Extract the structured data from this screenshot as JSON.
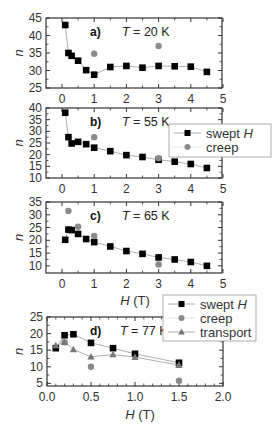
{
  "chart_data": [
    {
      "type": "scatter",
      "panel": "a)",
      "annotation": "T = 20 K",
      "xlabel": "",
      "ylabel": "n",
      "xlim": [
        -0.5,
        5
      ],
      "ylim": [
        25,
        45
      ],
      "xticks": [
        0,
        1,
        2,
        3,
        4,
        5
      ],
      "yticks": [
        25,
        30,
        35,
        40,
        45
      ],
      "series": [
        {
          "name": "swept H",
          "marker": "square",
          "color": "#000000",
          "line": true,
          "x": [
            0.1,
            0.2,
            0.3,
            0.5,
            0.75,
            1,
            1.5,
            2,
            2.5,
            3,
            3.5,
            4,
            4.5
          ],
          "y": [
            43,
            35,
            34.2,
            32.8,
            30.1,
            28.8,
            31,
            31.3,
            30.8,
            31.3,
            31.2,
            31.1,
            29.6
          ]
        },
        {
          "name": "creep",
          "marker": "circle",
          "color": "#8a8a8a",
          "line": false,
          "x": [
            1,
            3
          ],
          "y": [
            34.8,
            37
          ]
        }
      ]
    },
    {
      "type": "scatter",
      "panel": "b)",
      "annotation": "T = 55 K",
      "xlabel": "",
      "ylabel": "n",
      "xlim": [
        -0.5,
        5
      ],
      "ylim": [
        10,
        40
      ],
      "xticks": [
        0,
        1,
        2,
        3,
        4,
        5
      ],
      "yticks": [
        10,
        15,
        20,
        25,
        30,
        35,
        40
      ],
      "legend": [
        "swept H",
        "creep"
      ],
      "series": [
        {
          "name": "swept H",
          "marker": "square",
          "color": "#000000",
          "line": true,
          "x": [
            0.1,
            0.2,
            0.3,
            0.5,
            0.75,
            1,
            1.5,
            2,
            2.5,
            3,
            3.5,
            4,
            4.5
          ],
          "y": [
            38,
            27.5,
            24.8,
            25.5,
            24.5,
            23,
            21.5,
            19.8,
            19,
            17.8,
            17,
            16,
            14.3
          ]
        },
        {
          "name": "creep",
          "marker": "circle",
          "color": "#8a8a8a",
          "line": false,
          "x": [
            1,
            3
          ],
          "y": [
            27.5,
            18.5
          ]
        }
      ]
    },
    {
      "type": "scatter",
      "panel": "c)",
      "annotation": "T = 65 K",
      "xlabel": "H (T)",
      "ylabel": "n",
      "xlim": [
        -0.5,
        5
      ],
      "ylim": [
        7.2,
        35
      ],
      "xticks": [
        0,
        1,
        2,
        3,
        4,
        5
      ],
      "yticks": [
        10,
        15,
        20,
        25,
        30,
        35
      ],
      "series": [
        {
          "name": "swept H",
          "marker": "square",
          "color": "#000000",
          "line": true,
          "x": [
            0.1,
            0.2,
            0.3,
            0.5,
            0.75,
            1,
            1.5,
            2,
            2.5,
            3,
            3.5,
            4,
            4.5
          ],
          "y": [
            20.2,
            24.2,
            24,
            22.5,
            20.5,
            19.3,
            17.6,
            15.8,
            14.7,
            13.3,
            12.5,
            11.5,
            10
          ]
        },
        {
          "name": "creep",
          "marker": "circle",
          "color": "#8a8a8a",
          "line": false,
          "x": [
            0.2,
            0.5,
            1,
            3
          ],
          "y": [
            31.5,
            25.3,
            21.7,
            10.5
          ]
        }
      ]
    },
    {
      "type": "line",
      "panel": "d)",
      "annotation": "T = 77 K",
      "xlabel": "H (T)",
      "ylabel": "n",
      "xlim": [
        0,
        2
      ],
      "ylim": [
        4.2,
        25
      ],
      "xticks": [
        0.0,
        0.5,
        1.0,
        1.5,
        2.0
      ],
      "yticks": [
        5,
        10,
        15,
        20,
        25
      ],
      "legend": [
        "swept H",
        "creep",
        "transport"
      ],
      "series": [
        {
          "name": "swept H",
          "marker": "square",
          "color": "#000000",
          "line": true,
          "x": [
            0.1,
            0.2,
            0.3,
            0.5,
            0.75,
            1,
            1.5
          ],
          "y": [
            15.6,
            19.5,
            19.8,
            17.2,
            15.6,
            13.9,
            11.2
          ]
        },
        {
          "name": "creep",
          "marker": "circle",
          "color": "#8a8a8a",
          "line": false,
          "x": [
            0.2,
            0.5,
            1.5
          ],
          "y": [
            17.4,
            10,
            5.8
          ]
        },
        {
          "name": "transport",
          "marker": "triangle",
          "color": "#777777",
          "line": true,
          "x": [
            0.1,
            0.2,
            0.3,
            0.5,
            0.75,
            1,
            1.5
          ],
          "y": [
            16.4,
            17.4,
            15.2,
            13,
            13.7,
            12.9,
            10.5
          ]
        }
      ]
    }
  ],
  "layout": {
    "frame_color": "#333333",
    "line_color": "#999999",
    "panels": [
      {
        "left": 46,
        "right": 222,
        "top": 18,
        "bottom": 88,
        "x0px": 62,
        "x_per_unit": 32.2
      },
      {
        "left": 46,
        "right": 222,
        "top": 108,
        "bottom": 178,
        "x0px": 62,
        "x_per_unit": 32.2
      },
      {
        "left": 46,
        "right": 222,
        "top": 202,
        "bottom": 273,
        "x0px": 62,
        "x_per_unit": 32.2
      },
      {
        "left": 47,
        "right": 223,
        "top": 317,
        "bottom": 386,
        "x0px": 47,
        "x_per_unit": 88
      }
    ],
    "legends": [
      {
        "panel": 1,
        "x": 169,
        "y": 124,
        "w": 102,
        "h": 33
      },
      {
        "panel": 3,
        "x": 163,
        "y": 295,
        "w": 93,
        "h": 46
      }
    ],
    "xtitles": [
      {
        "panel": 2,
        "x": 135,
        "y": 305
      },
      {
        "panel": 3,
        "x": 140,
        "y": 419
      }
    ]
  }
}
